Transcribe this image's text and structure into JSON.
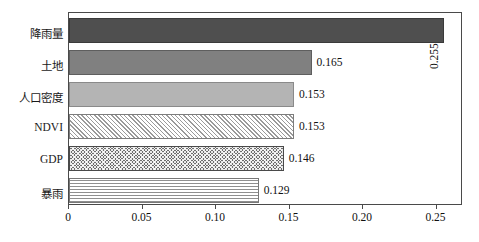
{
  "chart_data": {
    "type": "bar",
    "orientation": "horizontal",
    "title": "",
    "xlabel": "",
    "ylabel": "",
    "xlim": [
      0,
      0.268
    ],
    "ylim": [
      0,
      6
    ],
    "grid": false,
    "legend": "none",
    "categories": [
      "降雨量",
      "土地",
      "人口密度",
      "NDVI",
      "GDP",
      "暴雨"
    ],
    "values": [
      0.255,
      0.165,
      0.153,
      0.153,
      0.146,
      0.129
    ],
    "value_labels": [
      "0.255",
      "0.165",
      "0.153",
      "0.153",
      "0.146",
      "0.129"
    ],
    "xticks": [
      0,
      0.05,
      0.1,
      0.15,
      0.2,
      0.25
    ],
    "xtick_labels": [
      "0",
      "0.05",
      "0.10",
      "0.15",
      "0.20",
      "0.25"
    ],
    "bar_fills": [
      "solid-dark-gray",
      "solid-medium-gray",
      "solid-light-gray",
      "diagonal-hatch",
      "dense-checker",
      "horizontal-stripes"
    ],
    "colors": {
      "solid_dark": "#4f4f4f",
      "solid_medium": "#808080",
      "solid_light": "#b4b4b4",
      "hatch_fg": "#9a9a9a",
      "checker_bg": "#6e6e6e",
      "stripe_fg": "#8f8f8f",
      "frame": "#4a4a4a",
      "text": "#111111",
      "background": "#ffffff"
    }
  }
}
